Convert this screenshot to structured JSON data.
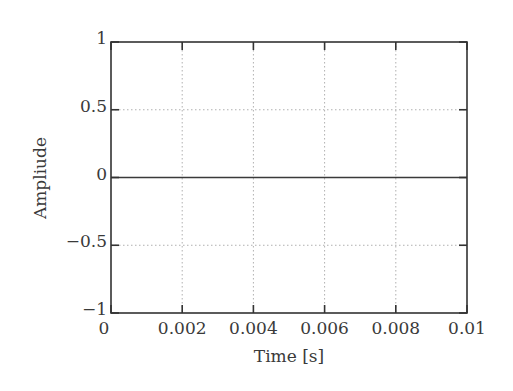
{
  "chart_data": {
    "type": "line",
    "title": "",
    "xlabel": "Time [s]",
    "ylabel": "Ampliude",
    "xlim": [
      0,
      0.01
    ],
    "ylim": [
      -1,
      1
    ],
    "grid": true,
    "grid_style": "dotted",
    "legend": null,
    "x_ticks": [
      0,
      0.002,
      0.004,
      0.006,
      0.008,
      0.01
    ],
    "x_tick_labels": [
      "0",
      "0.002",
      "0.004",
      "0.006",
      "0.008",
      "0.01"
    ],
    "y_ticks": [
      1,
      0.5,
      0,
      -0.5,
      -1
    ],
    "y_tick_labels": [
      "1",
      "0.5",
      "0",
      "−0.5",
      "−1"
    ],
    "series": [
      {
        "name": "signal",
        "color": "#3a3a3a",
        "x": [
          0,
          0.002,
          0.004,
          0.006,
          0.008,
          0.01
        ],
        "y": [
          0,
          0,
          0,
          0,
          0,
          0
        ]
      }
    ]
  },
  "colors": {
    "axes": "#333333",
    "grid": "#b0b0b0",
    "text": "#3a3a3a",
    "background": "#ffffff"
  }
}
